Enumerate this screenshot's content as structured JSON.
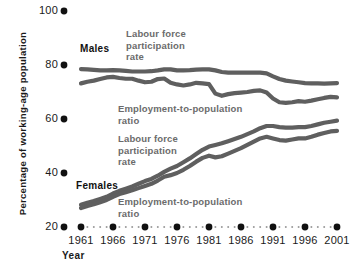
{
  "chart_data": {
    "type": "line",
    "title": "",
    "xlabel": "Year",
    "ylabel": "Percentage of working-age population",
    "xlim": [
      1961,
      2001
    ],
    "ylim": [
      20,
      100
    ],
    "xticks": [
      "1961",
      "1966",
      "1971",
      "1976",
      "1981",
      "1986",
      "1991",
      "1996",
      "2001"
    ],
    "yticks": [
      "20",
      "40",
      "60",
      "80",
      "100"
    ],
    "grid": false,
    "legend_position": "inline-annotations",
    "axis_style": "dotted-marker-axis",
    "line_color": "#5f5f5f",
    "x": [
      1961,
      1962,
      1963,
      1964,
      1965,
      1966,
      1967,
      1968,
      1969,
      1970,
      1971,
      1972,
      1973,
      1974,
      1975,
      1976,
      1977,
      1978,
      1979,
      1980,
      1981,
      1982,
      1983,
      1984,
      1985,
      1986,
      1987,
      1988,
      1989,
      1990,
      1991,
      1992,
      1993,
      1994,
      1995,
      1996,
      1997,
      1998,
      1999,
      2000,
      2001
    ],
    "series": [
      {
        "name": "Males - Labour force participation rate",
        "values": [
          78.5,
          78.4,
          78.2,
          78.0,
          78.0,
          78.1,
          78.0,
          77.8,
          77.6,
          77.6,
          77.6,
          77.7,
          78.0,
          78.4,
          78.4,
          78.0,
          78.0,
          78.1,
          78.3,
          78.4,
          78.4,
          78.0,
          77.4,
          77.2,
          77.2,
          77.2,
          77.2,
          77.2,
          77.2,
          76.9,
          75.8,
          74.8,
          74.2,
          73.9,
          73.6,
          73.3,
          73.2,
          73.2,
          73.1,
          73.2,
          73.3
        ]
      },
      {
        "name": "Males - Employment-to-population ratio",
        "values": [
          73.2,
          73.8,
          74.2,
          74.8,
          75.4,
          75.6,
          75.2,
          74.9,
          74.9,
          74.2,
          73.6,
          73.8,
          74.8,
          75.0,
          73.4,
          72.8,
          72.4,
          72.8,
          73.4,
          73.2,
          72.9,
          69.4,
          68.6,
          69.2,
          69.6,
          69.8,
          70.0,
          70.4,
          70.6,
          69.8,
          67.6,
          66.2,
          66.0,
          66.2,
          66.6,
          66.4,
          66.8,
          67.3,
          67.8,
          68.2,
          68.0
        ]
      },
      {
        "name": "Females - Labour force participation rate",
        "values": [
          28.2,
          29.0,
          29.6,
          30.4,
          31.2,
          32.4,
          33.4,
          34.2,
          35.0,
          36.0,
          37.0,
          37.8,
          39.0,
          40.4,
          41.6,
          42.6,
          44.0,
          45.4,
          47.0,
          48.6,
          49.8,
          50.4,
          51.0,
          51.8,
          52.6,
          53.4,
          54.4,
          55.4,
          56.6,
          57.4,
          57.4,
          57.0,
          56.8,
          56.8,
          57.0,
          57.0,
          57.4,
          58.0,
          58.6,
          59.0,
          59.4
        ]
      },
      {
        "name": "Females - Employment-to-population ratio",
        "values": [
          27.0,
          27.8,
          28.4,
          29.2,
          30.0,
          31.2,
          32.2,
          32.9,
          33.6,
          34.4,
          35.2,
          36.0,
          37.2,
          38.6,
          39.2,
          40.0,
          41.2,
          42.6,
          44.2,
          45.6,
          46.4,
          45.8,
          46.2,
          47.2,
          48.2,
          49.2,
          50.4,
          51.6,
          52.8,
          53.4,
          52.8,
          52.2,
          52.0,
          52.4,
          52.8,
          52.8,
          53.4,
          54.2,
          54.8,
          55.4,
          55.6
        ]
      }
    ],
    "annotations": [
      {
        "id": "males-group",
        "text": "Males"
      },
      {
        "id": "females-group",
        "text": "Females"
      },
      {
        "id": "males-lfp",
        "text": "Labour force\nparticipation\nrate"
      },
      {
        "id": "males-epr",
        "text": "Employment-to-population\nratio"
      },
      {
        "id": "females-lfp",
        "text": "Labour force\nparticipation\nrate"
      },
      {
        "id": "females-epr",
        "text": "Employment-to-population\nratio"
      }
    ]
  }
}
